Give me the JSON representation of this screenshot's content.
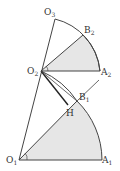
{
  "diagram": {
    "points": {
      "O1": {
        "label": "O",
        "sub": "1",
        "x": 19,
        "y": 160
      },
      "A1": {
        "label": "A",
        "sub": "1",
        "x": 102,
        "y": 160
      },
      "B1": {
        "label": "B",
        "sub": "1",
        "x": 77,
        "y": 99
      },
      "O2": {
        "label": "O",
        "sub": "2",
        "x": 41,
        "y": 71
      },
      "A2": {
        "label": "A",
        "sub": "2",
        "x": 100,
        "y": 71
      },
      "B2": {
        "label": "B",
        "sub": "2",
        "x": 83,
        "y": 35
      },
      "O3": {
        "label": "O",
        "sub": "3",
        "x": 55,
        "y": 19
      },
      "H": {
        "label": "H",
        "x": 68,
        "y": 107
      }
    },
    "colors": {
      "stroke": "#444444",
      "fill": "#e6e6e6"
    }
  }
}
